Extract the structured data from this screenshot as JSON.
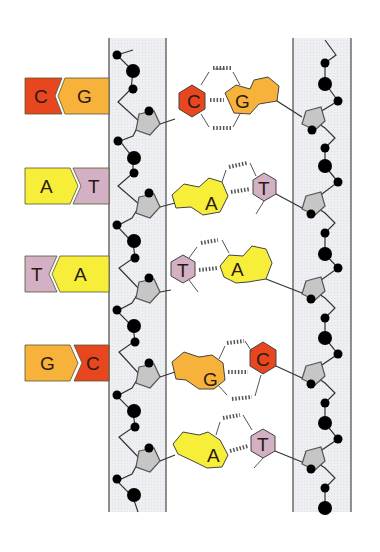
{
  "diagram": {
    "colors": {
      "cytosine": "#E8461E",
      "guanine": "#F7B23B",
      "adenine": "#F7EE3A",
      "thymine": "#D3B0C4",
      "sugar": "#C8C8C8",
      "phosphate": "#000000",
      "strand_band": "#ECEEF1",
      "outline": "#3a3a3a"
    },
    "legend": [
      {
        "left": "C",
        "right": "G",
        "left_color": "#E8461E",
        "right_color": "#F7B23B"
      },
      {
        "left": "A",
        "right": "T",
        "left_color": "#F7EE3A",
        "right_color": "#D3B0C4"
      },
      {
        "left": "T",
        "right": "A",
        "left_color": "#D3B0C4",
        "right_color": "#F7EE3A"
      },
      {
        "left": "G",
        "right": "C",
        "left_color": "#F7B23B",
        "right_color": "#E8461E"
      }
    ],
    "base_pairs": [
      {
        "left": "C",
        "right": "G",
        "hydrogen_bonds": 3
      },
      {
        "left": "A",
        "right": "T",
        "hydrogen_bonds": 2
      },
      {
        "left": "T",
        "right": "A",
        "hydrogen_bonds": 2
      },
      {
        "left": "G",
        "right": "C",
        "hydrogen_bonds": 3
      },
      {
        "left": "A",
        "right": "T",
        "hydrogen_bonds": 2
      }
    ]
  }
}
